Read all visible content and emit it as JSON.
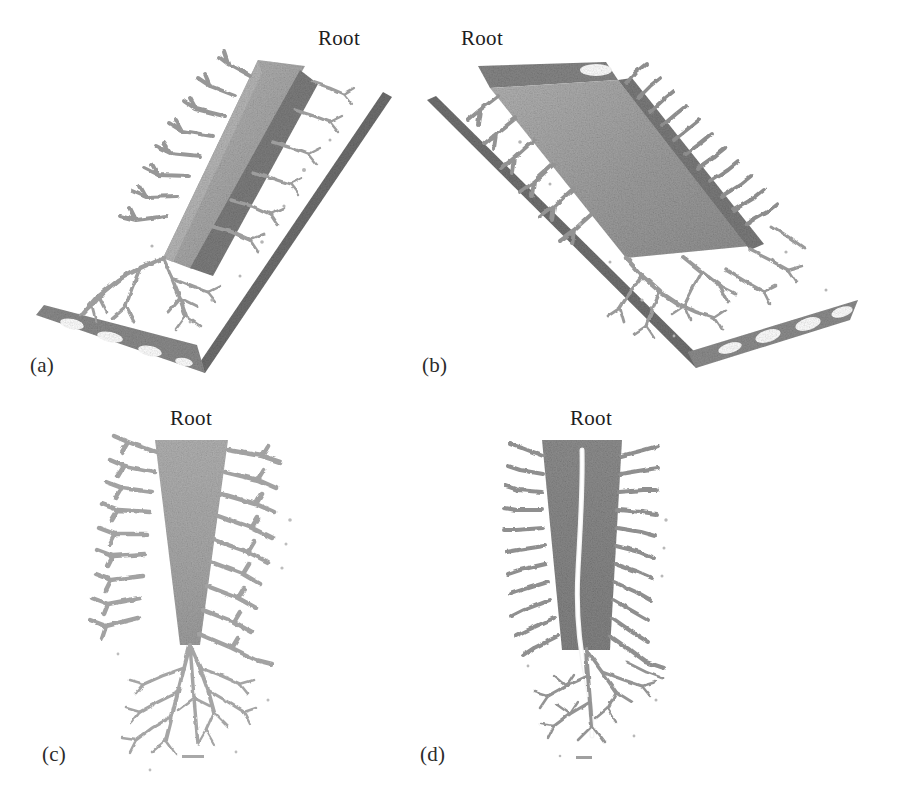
{
  "figure": {
    "background_color": "#ffffff",
    "type": "multi-panel-3d-reconstruction",
    "panel_count": 4,
    "shared_annotation": "Root"
  },
  "panels": [
    {
      "id": "a",
      "label": "(a)",
      "root_label": "Root",
      "view": "oblique-3d-view-tilted-left",
      "description": "Tapering wedge-shaped root body rendered in light gray with dense noisy voxel texture, oriented diagonally from upper-right to lower-left, with a darker granular lateral band and many branching lateral rootlets extending to the lower-left; a thin dark slab edge runs parallel below and a perforated plate appears at the lower-left end.",
      "body_color": "#a8a8a8",
      "band_color": "#7f7f7f",
      "branch_color": "#9c9c9c",
      "has_perforated_plate": true,
      "has_scale_rail": true
    },
    {
      "id": "b",
      "label": "(b)",
      "root_label": "Root",
      "view": "oblique-3d-view-tilted-right",
      "description": "Mirrored oblique view of the same root; wedge body runs from upper-left to lower-right with visible flat top face and elliptical opening, a row of regularly spaced lateral rootlets along the lower-right edge, a long thin slab rail crossing diagonally, and a perforated plate with elliptical and triangular holes at the lower-right end.",
      "body_color": "#9e9e9e",
      "band_color": "#787878",
      "branch_color": "#949494",
      "has_perforated_plate": true,
      "has_scale_rail": true
    },
    {
      "id": "c",
      "label": "(c)",
      "root_label": "Root",
      "view": "frontal-projection",
      "description": "Front-on vertical projection: a downward-tapering gray wedge (wide at the top, narrow at the bottom) with symmetric lateral rootlets branching left and right at regular intervals, terminating in a fine dendritic network of fibrous roots below.",
      "body_color": "#ababab",
      "branch_color": "#a0a0a0",
      "has_scale_bar": true
    },
    {
      "id": "d",
      "label": "(d)",
      "root_label": "Root",
      "view": "sagittal-projection",
      "description": "Side-on vertical projection: a darker gray near-rectangular body with a bright white central channel (lumen) running the full length, short dense lateral rootlets along both edges, and a fine dendritic root network extending beyond the lower tip.",
      "body_color": "#848484",
      "channel_color": "#f2f2f2",
      "branch_color": "#8f8f8f",
      "has_scale_bar": true
    }
  ],
  "colors": {
    "background": "#ffffff",
    "text": "#1d1d1d",
    "light_gray_tissue": "#ababab",
    "mid_gray_tissue": "#8d8d8d",
    "dark_gray_tissue": "#6f6f6f",
    "channel_highlight": "#f2f2f2"
  }
}
